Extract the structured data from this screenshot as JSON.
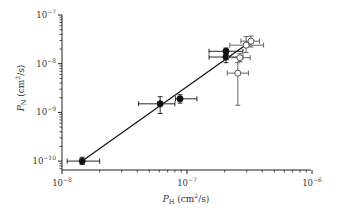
{
  "chart_data": {
    "type": "scatter",
    "title": "",
    "xlabel": "P_H (cm²/s)",
    "ylabel": "P_N (cm²/s)",
    "xscale": "log",
    "yscale": "log",
    "xlim": [
      1e-08,
      1e-06
    ],
    "ylim": [
      5.5e-11,
      1e-07
    ],
    "x_ticks": [
      "10^-8",
      "10^-7",
      "10^-6"
    ],
    "y_ticks": [
      "10^-10",
      "10^-9",
      "10^-8",
      "10^-7"
    ],
    "grid": false,
    "legend": null,
    "series": [
      {
        "name": "filled",
        "marker": "filled-circle",
        "color": "#111111",
        "points": [
          {
            "x": 1.45e-08,
            "y": 1e-10,
            "xerr": [
              1.1e-08,
              2e-08
            ],
            "yerr": [
              8.5e-11,
              1.2e-10
            ]
          },
          {
            "x": 6.1e-08,
            "y": 1.5e-09,
            "xerr": [
              4.1e-08,
              8e-08
            ],
            "yerr": [
              9.5e-10,
              2.1e-09
            ]
          },
          {
            "x": 8.8e-08,
            "y": 1.9e-09,
            "xerr": [
              8.1e-08,
              1.2e-07
            ],
            "yerr": [
              1.55e-09,
              2.3e-09
            ]
          },
          {
            "x": 2.05e-07,
            "y": 1.8e-08,
            "xerr": [
              1.5e-07,
              2.8e-07
            ],
            "yerr": [
              1.55e-08,
              2.1e-08
            ]
          },
          {
            "x": 2.05e-07,
            "y": 1.37e-08,
            "xerr": [
              1.5e-07,
              2.8e-07
            ],
            "yerr": [
              1.05e-08,
              1.7e-08
            ]
          }
        ]
      },
      {
        "name": "open",
        "marker": "open-circle",
        "color": "#555555",
        "points": [
          {
            "x": 2.65e-07,
            "y": 1.33e-08,
            "xerr": [
              2.15e-07,
              3.2e-07
            ],
            "yerr": [
              1.1e-08,
              1.6e-08
            ]
          },
          {
            "x": 2.55e-07,
            "y": 6.4e-09,
            "xerr": [
              2.1e-07,
              3.1e-07
            ],
            "yerr": [
              1.4e-09,
              1.05e-08
            ]
          },
          {
            "x": 2.97e-07,
            "y": 2.4e-08,
            "xerr": [
              2.2e-07,
              4.1e-07
            ],
            "yerr": [
              1.7e-08,
              3.6e-08
            ]
          },
          {
            "x": 3.25e-07,
            "y": 2.9e-08,
            "xerr": [
              2.7e-07,
              3.8e-07
            ],
            "yerr": [
              2.2e-08,
              3.7e-08
            ]
          }
        ]
      }
    ],
    "fit_line": {
      "from": {
        "x": 1.45e-08,
        "y": 1e-10
      },
      "to": {
        "x": 3.25e-07,
        "y": 2.9e-08
      }
    }
  },
  "axes": {
    "x": {
      "label_main": "P",
      "label_sub": "H",
      "label_unit": " (cm",
      "label_unit_sup": "2",
      "label_unit_end": "/s)"
    },
    "y": {
      "label_main": "P",
      "label_sub": "N",
      "label_unit": " (cm",
      "label_unit_sup": "2",
      "label_unit_end": "/s)"
    }
  }
}
